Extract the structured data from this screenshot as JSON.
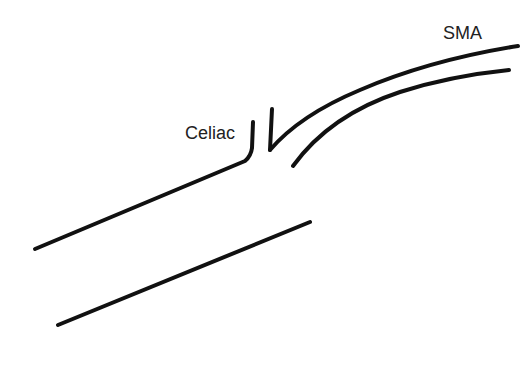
{
  "diagram": {
    "type": "vessel-schematic",
    "labels": {
      "celiac": "Celiac",
      "sma": "SMA"
    },
    "colors": {
      "background": "#ffffff",
      "stroke": "#111111",
      "text": "#222222"
    },
    "structures": [
      {
        "name": "aorta",
        "description": "two parallel diagonal lines"
      },
      {
        "name": "celiac",
        "description": "short branch stub"
      },
      {
        "name": "sma",
        "description": "curved branch extending up-right"
      }
    ]
  }
}
